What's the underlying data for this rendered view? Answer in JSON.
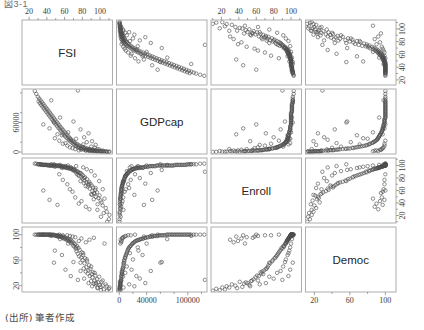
{
  "figure": {
    "type": "scatterplot-matrix",
    "top_fragment": "図3-1",
    "caption": "(出所) 筆者作成",
    "variables": [
      "FSI",
      "GDPcap",
      "Enroll",
      "Democ"
    ],
    "n_rows": 4,
    "n_cols": 4,
    "marker": "open-circle",
    "marker_color": "#4c4c4c",
    "panel_border_color": "#9a9a9a",
    "background": "#ffffff"
  },
  "axes": {
    "FSI": {
      "label": "FSI",
      "ticks": [
        20,
        40,
        60,
        80,
        100
      ],
      "tick_labels": [
        "20",
        "40",
        "60",
        "80",
        "100"
      ],
      "range": [
        12,
        114
      ],
      "minor_ticks": [
        10,
        30,
        50,
        70,
        90,
        110
      ]
    },
    "GDPcap": {
      "label": "GDPcap",
      "ticks": [
        0,
        40000,
        100000
      ],
      "tick_labels": [
        "0",
        "40000",
        "100000"
      ],
      "left_ticks": [
        0,
        60000
      ],
      "left_tick_labels": [
        "0",
        "60000"
      ],
      "range": [
        -4000,
        128000
      ],
      "minor_ticks": [
        20000,
        60000,
        80000,
        120000
      ]
    },
    "Enroll": {
      "label": "Enroll",
      "ticks": [
        20,
        40,
        60,
        80,
        100
      ],
      "tick_labels": [
        "20",
        "40",
        "60",
        "80",
        "100"
      ],
      "range": [
        8,
        112
      ],
      "minor_ticks": [
        10,
        30,
        50,
        70,
        90,
        110
      ]
    },
    "Democ": {
      "label": "Democ",
      "ticks": [
        20,
        60,
        100
      ],
      "tick_labels": [
        "20",
        "60",
        "100"
      ],
      "range": [
        10,
        112
      ],
      "minor_ticks": [
        40,
        80
      ]
    }
  },
  "chart_data": {
    "type": "scatter",
    "title": "",
    "subtitle": "",
    "xlabel": "",
    "ylabel": "",
    "legend": [],
    "grid": false,
    "matrix_variables": [
      "FSI",
      "GDPcap",
      "Enroll",
      "Democ"
    ],
    "axis_ranges": {
      "FSI": [
        12,
        114
      ],
      "GDPcap": [
        -4000,
        128000
      ],
      "Enroll": [
        8,
        112
      ],
      "Democ": [
        10,
        112
      ]
    },
    "observations": [
      {
        "FSI": 110.6,
        "GDPcap": 760,
        "Enroll": 21,
        "Democ": 17
      },
      {
        "FSI": 109.9,
        "GDPcap": 460,
        "Enroll": 14,
        "Democ": 15
      },
      {
        "FSI": 107.5,
        "GDPcap": 820,
        "Enroll": 26,
        "Democ": 19
      },
      {
        "FSI": 106.4,
        "GDPcap": 1100,
        "Enroll": 32,
        "Democ": 22
      },
      {
        "FSI": 104.1,
        "GDPcap": 600,
        "Enroll": 24,
        "Democ": 14
      },
      {
        "FSI": 102.9,
        "GDPcap": 1450,
        "Enroll": 36,
        "Democ": 20
      },
      {
        "FSI": 101.7,
        "GDPcap": 980,
        "Enroll": 41,
        "Democ": 26
      },
      {
        "FSI": 100.6,
        "GDPcap": 1250,
        "Enroll": 44,
        "Democ": 18
      },
      {
        "FSI": 99.4,
        "GDPcap": 2100,
        "Enroll": 52,
        "Democ": 21
      },
      {
        "FSI": 98.1,
        "GDPcap": 1700,
        "Enroll": 48,
        "Democ": 25
      },
      {
        "FSI": 97.2,
        "GDPcap": 900,
        "Enroll": 38,
        "Democ": 16
      },
      {
        "FSI": 96.5,
        "GDPcap": 2600,
        "Enroll": 57,
        "Democ": 30
      },
      {
        "FSI": 95.3,
        "GDPcap": 1850,
        "Enroll": 50,
        "Democ": 24
      },
      {
        "FSI": 94.6,
        "GDPcap": 3100,
        "Enroll": 61,
        "Democ": 36
      },
      {
        "FSI": 93.8,
        "GDPcap": 2250,
        "Enroll": 55,
        "Democ": 28
      },
      {
        "FSI": 92.9,
        "GDPcap": 1550,
        "Enroll": 46,
        "Democ": 23
      },
      {
        "FSI": 92.1,
        "GDPcap": 3600,
        "Enroll": 65,
        "Democ": 41
      },
      {
        "FSI": 91.4,
        "GDPcap": 2900,
        "Enroll": 59,
        "Democ": 33
      },
      {
        "FSI": 90.7,
        "GDPcap": 4200,
        "Enroll": 68,
        "Democ": 38
      },
      {
        "FSI": 89.9,
        "GDPcap": 2400,
        "Enroll": 54,
        "Democ": 27
      },
      {
        "FSI": 89.1,
        "GDPcap": 5100,
        "Enroll": 71,
        "Democ": 46
      },
      {
        "FSI": 88.4,
        "GDPcap": 3300,
        "Enroll": 63,
        "Democ": 35
      },
      {
        "FSI": 87.6,
        "GDPcap": 6200,
        "Enroll": 74,
        "Democ": 52
      },
      {
        "FSI": 86.8,
        "GDPcap": 4600,
        "Enroll": 69,
        "Democ": 44
      },
      {
        "FSI": 86.1,
        "GDPcap": 3800,
        "Enroll": 66,
        "Democ": 39
      },
      {
        "FSI": 85.3,
        "GDPcap": 7400,
        "Enroll": 78,
        "Democ": 58
      },
      {
        "FSI": 84.6,
        "GDPcap": 5600,
        "Enroll": 73,
        "Democ": 49
      },
      {
        "FSI": 83.8,
        "GDPcap": 4100,
        "Enroll": 67,
        "Democ": 42
      },
      {
        "FSI": 83.1,
        "GDPcap": 8600,
        "Enroll": 81,
        "Democ": 63
      },
      {
        "FSI": 82.4,
        "GDPcap": 6800,
        "Enroll": 76,
        "Democ": 55
      },
      {
        "FSI": 81.6,
        "GDPcap": 5200,
        "Enroll": 72,
        "Democ": 47
      },
      {
        "FSI": 80.9,
        "GDPcap": 9800,
        "Enroll": 84,
        "Democ": 68
      },
      {
        "FSI": 80.2,
        "GDPcap": 7100,
        "Enroll": 79,
        "Democ": 60
      },
      {
        "FSI": 79.4,
        "GDPcap": 11200,
        "Enroll": 86,
        "Democ": 72
      },
      {
        "FSI": 78.7,
        "GDPcap": 8200,
        "Enroll": 82,
        "Democ": 64
      },
      {
        "FSI": 77.9,
        "GDPcap": 6400,
        "Enroll": 75,
        "Democ": 56
      },
      {
        "FSI": 77.1,
        "GDPcap": 12600,
        "Enroll": 88,
        "Democ": 76
      },
      {
        "FSI": 76.4,
        "GDPcap": 9200,
        "Enroll": 83,
        "Democ": 66
      },
      {
        "FSI": 75.6,
        "GDPcap": 14000,
        "Enroll": 89,
        "Democ": 79
      },
      {
        "FSI": 74.9,
        "GDPcap": 10500,
        "Enroll": 85,
        "Democ": 70
      },
      {
        "FSI": 74.1,
        "GDPcap": 16200,
        "Enroll": 91,
        "Democ": 82
      },
      {
        "FSI": 73.4,
        "GDPcap": 11800,
        "Enroll": 87,
        "Democ": 74
      },
      {
        "FSI": 72.6,
        "GDPcap": 13400,
        "Enroll": 90,
        "Democ": 78
      },
      {
        "FSI": 71.9,
        "GDPcap": 18500,
        "Enroll": 93,
        "Democ": 85
      },
      {
        "FSI": 71.1,
        "GDPcap": 15100,
        "Enroll": 92,
        "Democ": 81
      },
      {
        "FSI": 70.4,
        "GDPcap": 20400,
        "Enroll": 94,
        "Democ": 87
      },
      {
        "FSI": 69.6,
        "GDPcap": 17000,
        "Enroll": 92,
        "Democ": 83
      },
      {
        "FSI": 68.9,
        "GDPcap": 22800,
        "Enroll": 95,
        "Democ": 89
      },
      {
        "FSI": 68.1,
        "GDPcap": 19200,
        "Enroll": 94,
        "Democ": 86
      },
      {
        "FSI": 67.4,
        "GDPcap": 25600,
        "Enroll": 96,
        "Democ": 91
      },
      {
        "FSI": 66.6,
        "GDPcap": 21500,
        "Enroll": 95,
        "Democ": 88
      },
      {
        "FSI": 65.9,
        "GDPcap": 28400,
        "Enroll": 96,
        "Democ": 92
      },
      {
        "FSI": 65.1,
        "GDPcap": 24000,
        "Enroll": 95,
        "Democ": 90
      },
      {
        "FSI": 64.4,
        "GDPcap": 31200,
        "Enroll": 97,
        "Democ": 93
      },
      {
        "FSI": 63.6,
        "GDPcap": 26800,
        "Enroll": 96,
        "Democ": 91
      },
      {
        "FSI": 62.9,
        "GDPcap": 34600,
        "Enroll": 97,
        "Democ": 94
      },
      {
        "FSI": 62.1,
        "GDPcap": 29400,
        "Enroll": 96,
        "Democ": 92
      },
      {
        "FSI": 61.4,
        "GDPcap": 37800,
        "Enroll": 98,
        "Democ": 95
      },
      {
        "FSI": 60.6,
        "GDPcap": 32000,
        "Enroll": 97,
        "Democ": 93
      },
      {
        "FSI": 59.9,
        "GDPcap": 41000,
        "Enroll": 98,
        "Democ": 96
      },
      {
        "FSI": 59.1,
        "GDPcap": 35200,
        "Enroll": 97,
        "Democ": 94
      },
      {
        "FSI": 58.4,
        "GDPcap": 44500,
        "Enroll": 99,
        "Democ": 97
      },
      {
        "FSI": 57.6,
        "GDPcap": 38400,
        "Enroll": 98,
        "Democ": 95
      },
      {
        "FSI": 56.9,
        "GDPcap": 47800,
        "Enroll": 99,
        "Democ": 97
      },
      {
        "FSI": 56.1,
        "GDPcap": 42200,
        "Enroll": 98,
        "Democ": 96
      },
      {
        "FSI": 55.4,
        "GDPcap": 51000,
        "Enroll": 99,
        "Democ": 98
      },
      {
        "FSI": 54.6,
        "GDPcap": 45600,
        "Enroll": 99,
        "Democ": 97
      },
      {
        "FSI": 53.9,
        "GDPcap": 54600,
        "Enroll": 100,
        "Democ": 98
      },
      {
        "FSI": 53.1,
        "GDPcap": 48800,
        "Enroll": 99,
        "Democ": 97
      },
      {
        "FSI": 52.4,
        "GDPcap": 58200,
        "Enroll": 100,
        "Democ": 99
      },
      {
        "FSI": 51.6,
        "GDPcap": 52400,
        "Enroll": 99,
        "Democ": 98
      },
      {
        "FSI": 50.9,
        "GDPcap": 61800,
        "Enroll": 100,
        "Democ": 99
      },
      {
        "FSI": 50.1,
        "GDPcap": 56000,
        "Enroll": 100,
        "Democ": 98
      },
      {
        "FSI": 49.4,
        "GDPcap": 65400,
        "Enroll": 100,
        "Democ": 99
      },
      {
        "FSI": 48.6,
        "GDPcap": 59600,
        "Enroll": 100,
        "Democ": 99
      },
      {
        "FSI": 47.9,
        "GDPcap": 69000,
        "Enroll": 100,
        "Democ": 100
      },
      {
        "FSI": 47.1,
        "GDPcap": 63200,
        "Enroll": 100,
        "Democ": 99
      },
      {
        "FSI": 46.4,
        "GDPcap": 72600,
        "Enroll": 100,
        "Democ": 100
      },
      {
        "FSI": 45.6,
        "GDPcap": 66800,
        "Enroll": 100,
        "Democ": 99
      },
      {
        "FSI": 44.9,
        "GDPcap": 76200,
        "Enroll": 100,
        "Democ": 100
      },
      {
        "FSI": 44.1,
        "GDPcap": 70400,
        "Enroll": 100,
        "Democ": 100
      },
      {
        "FSI": 43.4,
        "GDPcap": 79800,
        "Enroll": 100,
        "Democ": 100
      },
      {
        "FSI": 42.6,
        "GDPcap": 74000,
        "Enroll": 100,
        "Democ": 100
      },
      {
        "FSI": 41.9,
        "GDPcap": 83400,
        "Enroll": 101,
        "Democ": 100
      },
      {
        "FSI": 41.1,
        "GDPcap": 77600,
        "Enroll": 100,
        "Democ": 100
      },
      {
        "FSI": 40.4,
        "GDPcap": 87000,
        "Enroll": 101,
        "Democ": 100
      },
      {
        "FSI": 39.6,
        "GDPcap": 81200,
        "Enroll": 101,
        "Democ": 100
      },
      {
        "FSI": 38.9,
        "GDPcap": 90600,
        "Enroll": 101,
        "Democ": 100
      },
      {
        "FSI": 38.1,
        "GDPcap": 84800,
        "Enroll": 101,
        "Democ": 100
      },
      {
        "FSI": 37.4,
        "GDPcap": 94200,
        "Enroll": 101,
        "Democ": 100
      },
      {
        "FSI": 36.6,
        "GDPcap": 88400,
        "Enroll": 101,
        "Democ": 100
      },
      {
        "FSI": 35.9,
        "GDPcap": 97800,
        "Enroll": 101,
        "Democ": 100
      },
      {
        "FSI": 35.1,
        "GDPcap": 92000,
        "Enroll": 101,
        "Democ": 100
      },
      {
        "FSI": 34.4,
        "GDPcap": 101400,
        "Enroll": 102,
        "Democ": 100
      },
      {
        "FSI": 33.6,
        "GDPcap": 95600,
        "Enroll": 101,
        "Democ": 100
      },
      {
        "FSI": 32.9,
        "GDPcap": 105000,
        "Enroll": 102,
        "Democ": 100
      },
      {
        "FSI": 32.1,
        "GDPcap": 99200,
        "Enroll": 102,
        "Democ": 100
      },
      {
        "FSI": 31.4,
        "GDPcap": 108600,
        "Enroll": 102,
        "Democ": 100
      },
      {
        "FSI": 30.6,
        "GDPcap": 102800,
        "Enroll": 102,
        "Democ": 100
      },
      {
        "FSI": 29.9,
        "GDPcap": 112200,
        "Enroll": 102,
        "Democ": 100
      },
      {
        "FSI": 28.1,
        "GDPcap": 118000,
        "Enroll": 103,
        "Democ": 100
      },
      {
        "FSI": 26.4,
        "GDPcap": 124000,
        "Enroll": 103,
        "Democ": 100
      },
      {
        "FSI": 88.0,
        "GDPcap": 1900,
        "Enroll": 30,
        "Democ": 92
      },
      {
        "FSI": 84.0,
        "GDPcap": 2800,
        "Enroll": 34,
        "Democ": 88
      },
      {
        "FSI": 79.0,
        "GDPcap": 4800,
        "Enroll": 43,
        "Democ": 94
      },
      {
        "FSI": 76.0,
        "GDPcap": 3400,
        "Enroll": 39,
        "Democ": 90
      },
      {
        "FSI": 72.0,
        "GDPcap": 5900,
        "Enroll": 49,
        "Democ": 96
      },
      {
        "FSI": 69.0,
        "GDPcap": 7800,
        "Enroll": 58,
        "Democ": 97
      },
      {
        "FSI": 66.0,
        "GDPcap": 9500,
        "Enroll": 62,
        "Democ": 98
      },
      {
        "FSI": 63.0,
        "GDPcap": 13000,
        "Enroll": 70,
        "Democ": 99
      },
      {
        "FSI": 58.0,
        "GDPcap": 16800,
        "Enroll": 77,
        "Democ": 99
      },
      {
        "FSI": 54.0,
        "GDPcap": 23000,
        "Enroll": 86,
        "Democ": 100
      },
      {
        "FSI": 95.0,
        "GDPcap": 14500,
        "Enroll": 64,
        "Democ": 22
      },
      {
        "FSI": 91.0,
        "GDPcap": 22000,
        "Enroll": 53,
        "Democ": 19
      },
      {
        "FSI": 87.0,
        "GDPcap": 38000,
        "Enroll": 71,
        "Democ": 24
      },
      {
        "FSI": 82.0,
        "GDPcap": 30000,
        "Enroll": 80,
        "Democ": 31
      },
      {
        "FSI": 78.0,
        "GDPcap": 46000,
        "Enroll": 88,
        "Democ": 43
      },
      {
        "FSI": 70.0,
        "GDPcap": 62000,
        "Enroll": 93,
        "Democ": 57
      },
      {
        "FSI": 67.0,
        "GDPcap": 25000,
        "Enroll": 97,
        "Democ": 35
      },
      {
        "FSI": 61.0,
        "GDPcap": 18000,
        "Enroll": 99,
        "Democ": 45
      },
      {
        "FSI": 57.0,
        "GDPcap": 34000,
        "Enroll": 96,
        "Democ": 68
      },
      {
        "FSI": 49.0,
        "GDPcap": 28000,
        "Enroll": 98,
        "Democ": 75
      },
      {
        "FSI": 103.0,
        "GDPcap": 3000,
        "Enroll": 62,
        "Democ": 28
      },
      {
        "FSI": 99.0,
        "GDPcap": 5400,
        "Enroll": 75,
        "Democ": 34
      },
      {
        "FSI": 94.0,
        "GDPcap": 8800,
        "Enroll": 84,
        "Democ": 40
      },
      {
        "FSI": 90.0,
        "GDPcap": 11000,
        "Enroll": 91,
        "Democ": 50
      },
      {
        "FSI": 85.0,
        "GDPcap": 20000,
        "Enroll": 94,
        "Democ": 61
      },
      {
        "FSI": 81.0,
        "GDPcap": 15500,
        "Enroll": 97,
        "Democ": 71
      },
      {
        "FSI": 73.0,
        "GDPcap": 27000,
        "Enroll": 99,
        "Democ": 80
      },
      {
        "FSI": 64.0,
        "GDPcap": 40000,
        "Enroll": 100,
        "Democ": 86
      },
      {
        "FSI": 55.0,
        "GDPcap": 70000,
        "Enroll": 101,
        "Democ": 93
      },
      {
        "FSI": 45.0,
        "GDPcap": 105000,
        "Enroll": 102,
        "Democ": 98
      },
      {
        "FSI": 108.0,
        "GDPcap": 300,
        "Enroll": 10,
        "Democ": 12
      },
      {
        "FSI": 105.0,
        "GDPcap": 1600,
        "Enroll": 47,
        "Democ": 86
      },
      {
        "FSI": 101.0,
        "GDPcap": 2000,
        "Enroll": 18,
        "Democ": 13
      },
      {
        "FSI": 97.0,
        "GDPcap": 6000,
        "Enroll": 29,
        "Democ": 17
      },
      {
        "FSI": 93.0,
        "GDPcap": 4400,
        "Enroll": 56,
        "Democ": 95
      },
      {
        "FSI": 75.0,
        "GDPcap": 125000,
        "Enroll": 90,
        "Democ": 29
      },
      {
        "FSI": 36.0,
        "GDPcap": 56000,
        "Enroll": 60,
        "Democ": 100
      },
      {
        "FSI": 43.0,
        "GDPcap": 48000,
        "Enroll": 45,
        "Democ": 99
      },
      {
        "FSI": 52.0,
        "GDPcap": 36000,
        "Enroll": 37,
        "Democ": 97
      },
      {
        "FSI": 48.0,
        "GDPcap": 60000,
        "Enroll": 102,
        "Democ": 56
      }
    ]
  }
}
